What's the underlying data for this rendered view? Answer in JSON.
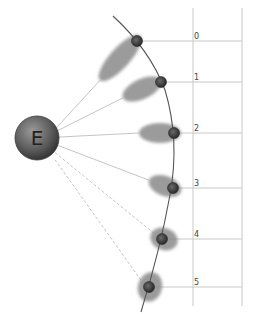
{
  "diagram": {
    "center_node": {
      "label": "E",
      "cx": 37,
      "cy": 138,
      "r": 22
    },
    "positions": [
      {
        "label": "0",
        "dot": [
          137,
          41
        ],
        "line_y": 41,
        "blur": {
          "cx": 120,
          "cy": 58,
          "rx": 30,
          "ry": 10,
          "rot": -48
        },
        "dashed": false
      },
      {
        "label": "1",
        "dot": [
          161,
          82
        ],
        "line_y": 82,
        "blur": {
          "cx": 142,
          "cy": 89,
          "rx": 21,
          "ry": 10,
          "rot": -25
        },
        "dashed": false
      },
      {
        "label": "2",
        "dot": [
          174,
          133
        ],
        "line_y": 133,
        "blur": {
          "cx": 160,
          "cy": 133,
          "rx": 21,
          "ry": 10,
          "rot": 0
        },
        "dashed": false
      },
      {
        "label": "3",
        "dot": [
          173,
          188
        ],
        "line_y": 188,
        "blur": {
          "cx": 165,
          "cy": 186,
          "rx": 17,
          "ry": 10,
          "rot": 20
        },
        "dashed": false
      },
      {
        "label": "4",
        "dot": [
          162,
          239
        ],
        "line_y": 239,
        "blur": {
          "cx": 164,
          "cy": 239,
          "rx": 14,
          "ry": 11,
          "rot": 20
        },
        "dashed": true
      },
      {
        "label": "5",
        "dot": [
          149,
          287
        ],
        "line_y": 287,
        "blur": {
          "cx": 150,
          "cy": 287,
          "rx": 12,
          "ry": 15,
          "rot": 15
        },
        "dashed": true
      }
    ],
    "grid": {
      "vlines_x": [
        193,
        242
      ],
      "top": 8,
      "bottom": 306,
      "right": 242
    },
    "colors": {
      "blur": "#8a8a8a",
      "dot": "#3a3a3a",
      "grid": "#c8c8c8",
      "ray": "#bdbdbd",
      "arc": "#555555"
    }
  }
}
